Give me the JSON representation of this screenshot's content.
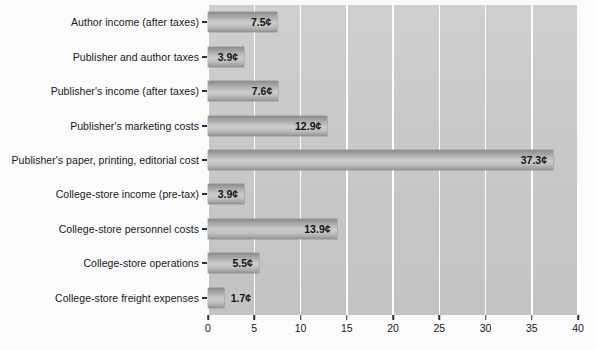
{
  "chart_data": {
    "type": "bar",
    "orientation": "horizontal",
    "title": "",
    "subtitle": "",
    "xlabel": "",
    "ylabel": "",
    "xlim": [
      0,
      40
    ],
    "xticks": [
      0,
      5,
      10,
      15,
      20,
      25,
      30,
      35,
      40
    ],
    "xtick_labels": [
      "0",
      "5",
      "10",
      "15",
      "20",
      "25",
      "30",
      "35",
      "40"
    ],
    "grid": "vertical",
    "legend": "none",
    "unit_symbol": "¢",
    "categories": [
      "Author income (after taxes)",
      "Publisher and author taxes",
      "Publisher's income (after taxes)",
      "Publisher's marketing costs",
      "Publisher's paper, printing, editorial cost",
      "College-store income (pre-tax)",
      "College-store personnel costs",
      "College-store operations",
      "College-store freight expenses"
    ],
    "values": [
      7.5,
      3.9,
      7.6,
      12.9,
      37.3,
      3.9,
      13.9,
      5.5,
      1.7
    ],
    "data_labels": [
      "7.5¢",
      "3.9¢",
      "7.6¢",
      "12.9¢",
      "37.3¢",
      "3.9¢",
      "13.9¢",
      "5.5¢",
      "1.7¢"
    ],
    "label_placement": [
      "inside",
      "inside",
      "inside",
      "inside",
      "inside",
      "inside",
      "inside",
      "inside",
      "outside"
    ],
    "colors": {
      "plot_background": "#c8c8c8",
      "page_background": "#fbfbfc",
      "gridline": "#fdfdfd",
      "bar_fill_light": "#cdcdcd",
      "bar_fill_dark": "#8d8d8d",
      "text": "#16181b",
      "tick": "#2b2e33"
    }
  }
}
